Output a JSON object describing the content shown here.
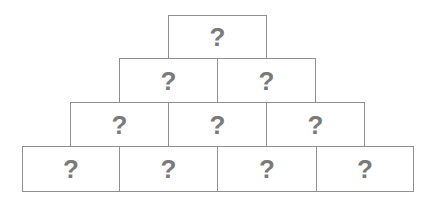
{
  "diagram": {
    "type": "number-pyramid",
    "rows": [
      {
        "cells": [
          {
            "label": "?"
          }
        ]
      },
      {
        "cells": [
          {
            "label": "?"
          },
          {
            "label": "?"
          }
        ]
      },
      {
        "cells": [
          {
            "label": "?"
          },
          {
            "label": "?"
          },
          {
            "label": "?"
          }
        ]
      },
      {
        "cells": [
          {
            "label": "?"
          },
          {
            "label": "?"
          },
          {
            "label": "?"
          },
          {
            "label": "?"
          }
        ]
      }
    ],
    "colors": {
      "border": "#8f8f8f",
      "text": "#7a7a7a",
      "background": "#ffffff"
    }
  }
}
